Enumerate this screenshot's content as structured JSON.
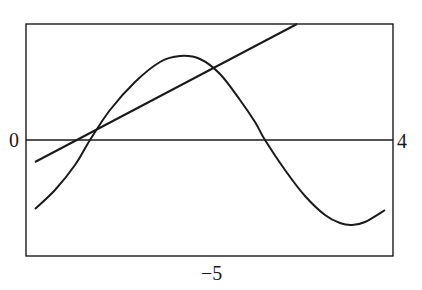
{
  "chart_data": {
    "type": "line",
    "title": "",
    "xlabel": "",
    "ylabel": "",
    "grid": false,
    "legend": null,
    "tick_labels": {
      "left": "0",
      "right": "4",
      "bottom": "−5"
    },
    "frame": {
      "left": 26,
      "right": 393,
      "top": 24,
      "bottom": 256
    },
    "reference_line": {
      "orientation": "horizontal",
      "y_px": 140
    },
    "series": [
      {
        "name": "straight line",
        "kind": "line",
        "points_px": [
          [
            35,
            162
          ],
          [
            297,
            24
          ]
        ]
      },
      {
        "name": "oscillating curve",
        "kind": "curve",
        "points_px": [
          [
            35,
            209
          ],
          [
            55,
            190
          ],
          [
            75,
            165
          ],
          [
            90,
            140
          ],
          [
            110,
            110
          ],
          [
            135,
            82
          ],
          [
            160,
            62
          ],
          [
            180,
            56
          ],
          [
            200,
            59
          ],
          [
            220,
            74
          ],
          [
            240,
            100
          ],
          [
            255,
            122
          ],
          [
            265,
            140
          ],
          [
            285,
            170
          ],
          [
            305,
            196
          ],
          [
            325,
            215
          ],
          [
            340,
            223
          ],
          [
            352,
            225
          ],
          [
            365,
            222
          ],
          [
            385,
            210
          ]
        ]
      }
    ],
    "colors": {
      "stroke": "#1a1a1a",
      "background": "#ffffff"
    }
  }
}
